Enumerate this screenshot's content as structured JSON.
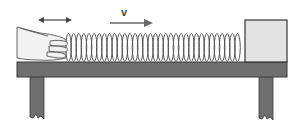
{
  "diagram": {
    "labels": {
      "velocity": "v"
    },
    "elements": {
      "hand": "hand compressing spring",
      "spring": "compressed coil spring",
      "block": "block at end of spring",
      "table": "table with two legs",
      "double_arrow": "oscillation arrow",
      "velocity_arrow": "velocity arrow pointing right"
    },
    "colors": {
      "table": "#6f6f6f",
      "table_border": "#3a3a3a",
      "block_fill": "#e3e3e3",
      "block_border": "#333333",
      "spring": "#555555",
      "arrow": "#444444",
      "velocity_arrow": "#666666",
      "hand_fill": "#f2f2f2",
      "hand_stroke": "#555555"
    },
    "spring": {
      "x_start": 66,
      "x_end": 240,
      "coil_count": 34
    }
  }
}
